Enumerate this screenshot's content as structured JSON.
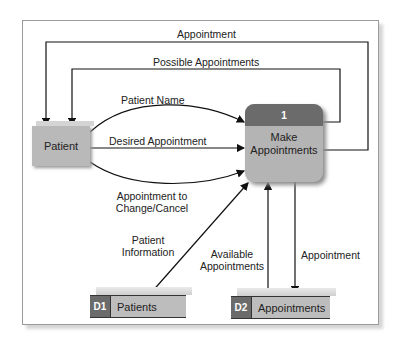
{
  "diagram": {
    "type": "data-flow-diagram",
    "external_entity": {
      "label": "Patient"
    },
    "process": {
      "number": "1",
      "label_line1": "Make",
      "label_line2": "Appointments"
    },
    "data_stores": [
      {
        "id": "D1",
        "label": "Patients"
      },
      {
        "id": "D2",
        "label": "Appointments"
      }
    ],
    "flows": {
      "appointment_top": "Appointment",
      "possible_appointments": "Possible Appointments",
      "patient_name": "Patient Name",
      "desired_appointment": "Desired Appointment",
      "appt_change_line1": "Appointment to",
      "appt_change_line2": "Change/Cancel",
      "patient_info_line1": "Patient",
      "patient_info_line2": "Information",
      "available_line1": "Available",
      "available_line2": "Appointments",
      "appointment_store": "Appointment"
    }
  },
  "colors": {
    "dark_header": "#6b6b6b",
    "box_fill": "#b9b9b9",
    "line": "#111111"
  }
}
